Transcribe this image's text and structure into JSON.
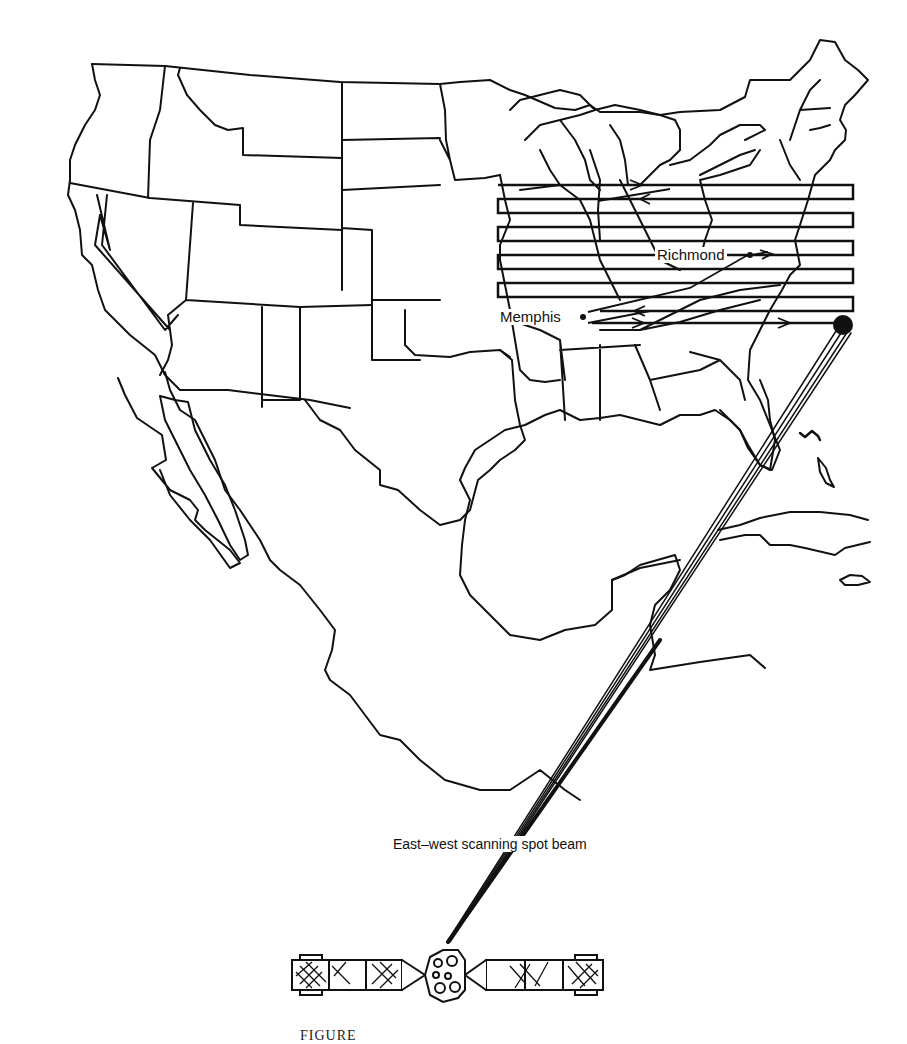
{
  "figure": {
    "caption_partial": "FIGURE",
    "colors": {
      "ink": "#111111",
      "paper": "#ffffff"
    }
  },
  "labels": {
    "city_1": "Richmond",
    "city_2": "Memphis",
    "beam": "East–west scanning spot beam"
  },
  "map": {
    "regions": [
      "Contiguous United States (state outlines)",
      "Mexico",
      "Gulf of Mexico",
      "Cuba",
      "Bahamas",
      "Jamaica"
    ]
  },
  "scan_pattern": {
    "direction": "east-west raster",
    "lines": 11,
    "start_point": "Memphis",
    "via": "Richmond",
    "end_spot": "beam spot (southeast)"
  },
  "satellite": {
    "icon": "satellite-icon",
    "solar_panels": 2
  }
}
